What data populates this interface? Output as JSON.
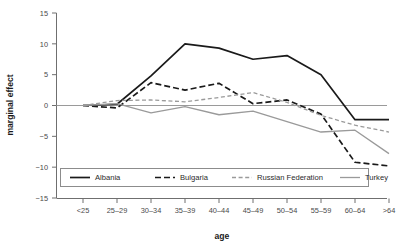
{
  "chart_data": {
    "type": "line",
    "title": "",
    "xlabel": "age",
    "ylabel": "marginal effect",
    "categories": [
      "<25",
      "25–29",
      "30–34",
      "35–39",
      "40–44",
      "45–49",
      "50–54",
      "55–59",
      "60–64",
      ">64"
    ],
    "ylim": [
      -15,
      15
    ],
    "yticks": [
      15,
      10,
      5,
      0,
      -5,
      -10,
      -15
    ],
    "ytick_labels": [
      "15",
      "10",
      "5",
      "0",
      "−5",
      "−10",
      "−15"
    ],
    "grid": false,
    "legend_position": "bottom-inside",
    "zero_reference_line": true,
    "series": [
      {
        "name": "Albania",
        "style": "solid",
        "color": "#1a1a1a",
        "width": 1.7,
        "values": [
          0.0,
          0.2,
          4.8,
          10.0,
          9.3,
          7.5,
          8.1,
          5.0,
          -2.3,
          -2.3
        ]
      },
      {
        "name": "Bulgaria",
        "style": "dashed",
        "color": "#1a1a1a",
        "width": 1.7,
        "values": [
          0.0,
          -0.4,
          3.7,
          2.5,
          3.6,
          0.3,
          0.9,
          -1.4,
          -9.2,
          -9.8
        ]
      },
      {
        "name": "Russian Federation",
        "style": "dashed",
        "color": "#9a9a9a",
        "width": 1.3,
        "values": [
          0.0,
          0.8,
          0.9,
          0.6,
          1.3,
          2.1,
          0.5,
          -1.6,
          -3.2,
          -4.3
        ]
      },
      {
        "name": "Turkey",
        "style": "solid",
        "color": "#9a9a9a",
        "width": 1.3,
        "values": [
          0.0,
          0.3,
          -1.2,
          -0.2,
          -1.5,
          -0.9,
          -2.6,
          -4.3,
          -4.0,
          -7.8
        ]
      }
    ]
  },
  "legend": {
    "items": [
      {
        "label": "Albania"
      },
      {
        "label": "Bulgaria"
      },
      {
        "label": "Russian Federation"
      },
      {
        "label": "Turkey"
      }
    ]
  }
}
